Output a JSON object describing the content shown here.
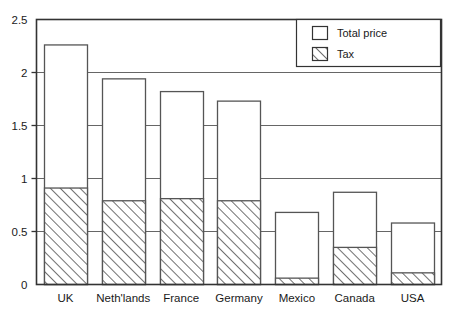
{
  "chart_data": {
    "type": "bar",
    "title": "",
    "subtitle": "",
    "xlabel": "",
    "ylabel": "",
    "categories": [
      "UK",
      "Neth'lands",
      "France",
      "Germany",
      "Mexico",
      "Canada",
      "USA"
    ],
    "series": [
      {
        "name": "Total price",
        "values": [
          2.26,
          1.94,
          1.82,
          1.73,
          0.68,
          0.87,
          0.58
        ]
      },
      {
        "name": "Tax",
        "values": [
          0.91,
          0.79,
          0.81,
          0.79,
          0.06,
          0.35,
          0.11
        ]
      }
    ],
    "ylim": [
      0,
      2.5
    ],
    "yticks": [
      0,
      0.5,
      1,
      1.5,
      2,
      2.5
    ],
    "ytick_labels": [
      "0",
      "0.5",
      "1",
      "1.5",
      "2",
      "2.5"
    ],
    "grid": true,
    "grid_axis": "y",
    "legend_position": "top-right",
    "legend_entries": [
      {
        "label": "Total price",
        "style": "outline",
        "fill": "#ffffff"
      },
      {
        "label": "Tax",
        "style": "hatched",
        "fill": "#ffffff"
      }
    ],
    "colors": {
      "bar_outline": "#555555",
      "bar_fill": "#ffffff",
      "hatch_line": "#333333",
      "gridline": "#666666",
      "axis": "#333333",
      "text": "#1a1a1a",
      "background": "#ffffff"
    }
  }
}
